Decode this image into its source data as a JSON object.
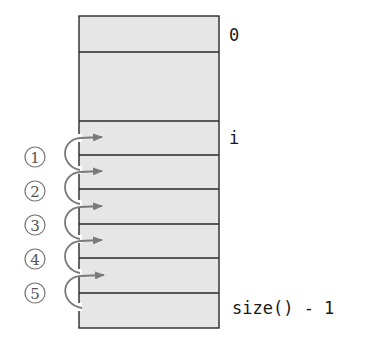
{
  "diagram": {
    "colors": {
      "cell_fill": "#e6e6e6",
      "border": "#2a2a2a",
      "arrow": "#7a7a7a",
      "step_label": "#555555"
    },
    "index_labels": {
      "top": "0",
      "middle": "i",
      "bottom": "size() - 1"
    },
    "steps": [
      {
        "num": "1"
      },
      {
        "num": "2"
      },
      {
        "num": "3"
      },
      {
        "num": "4"
      },
      {
        "num": "5"
      }
    ]
  }
}
